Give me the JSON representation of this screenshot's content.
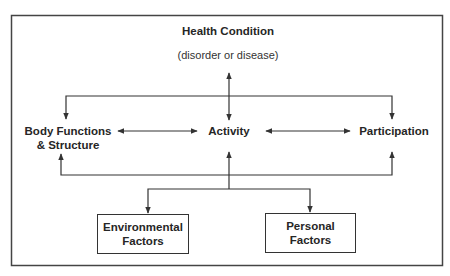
{
  "diagram": {
    "type": "ICF model",
    "health_condition": {
      "title": "Health Condition",
      "subtitle": "(disorder or disease)"
    },
    "components": {
      "body": {
        "line1": "Body Functions",
        "line2": "& Structure"
      },
      "activity": "Activity",
      "participation": "Participation"
    },
    "contextual_factors": {
      "environmental": {
        "line1": "Environmental",
        "line2": "Factors"
      },
      "personal": {
        "line1": "Personal",
        "line2": "Factors"
      }
    },
    "connections": [
      {
        "from": "Health Condition",
        "to": "Activity",
        "direction": "bidirectional"
      },
      {
        "from": "Health Condition",
        "to": "Body Functions & Structure",
        "direction": "to"
      },
      {
        "from": "Health Condition",
        "to": "Participation",
        "direction": "to"
      },
      {
        "from": "Body Functions & Structure",
        "to": "Activity",
        "direction": "bidirectional"
      },
      {
        "from": "Activity",
        "to": "Participation",
        "direction": "bidirectional"
      },
      {
        "from": "Contextual Factors",
        "to": "Body Functions & Structure",
        "direction": "to"
      },
      {
        "from": "Contextual Factors",
        "to": "Activity",
        "direction": "to"
      },
      {
        "from": "Contextual Factors",
        "to": "Participation",
        "direction": "to"
      },
      {
        "from": "Activity",
        "to": "Environmental Factors",
        "direction": "to"
      },
      {
        "from": "Activity",
        "to": "Personal Factors",
        "direction": "to"
      }
    ],
    "colors": {
      "line": "#333333",
      "text": "#262626",
      "background": "#ffffff"
    }
  }
}
